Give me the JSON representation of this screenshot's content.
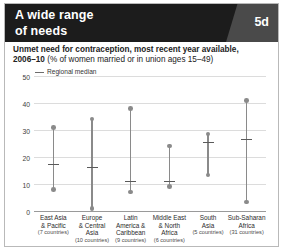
{
  "header": {
    "title_line1": "A wide range",
    "title_line2": "of needs",
    "figure_tag": "5d"
  },
  "subtitle": {
    "line1": "Unmet need for contraception, most recent year available,",
    "line2_bold": "2006–10",
    "line2_rest": " (% of women married or in union ages 15–49)"
  },
  "legend": {
    "label": "Regional median"
  },
  "colors": {
    "header_bg": "#1c1c1c",
    "tag_bg": "#4a4a4a",
    "marker": "#8a8a8a",
    "median": "#5a5a5a",
    "grid": "#dcdcdc"
  },
  "chart_data": {
    "type": "range",
    "title": "Unmet need for contraception, most recent year available, 2006–10 (% of women married or in union ages 15–49)",
    "xlabel": "",
    "ylabel": "",
    "ylim": [
      0,
      50
    ],
    "yticks": [
      0,
      10,
      20,
      30,
      40,
      50
    ],
    "grid": true,
    "legend_position": "top-left",
    "legend_entries": [
      "Regional median"
    ],
    "categories": [
      "East Asia & Pacific",
      "Europe & Central Asia",
      "Latin America & Caribbean",
      "Middle East & North Africa",
      "South Asia",
      "Sub-Saharan Africa"
    ],
    "category_lines": [
      [
        "East Asia",
        "& Pacific"
      ],
      [
        "Europe",
        "& Central",
        "Asia"
      ],
      [
        "Latin",
        "America &",
        "Caribbean"
      ],
      [
        "Middle East",
        "& North",
        "Africa"
      ],
      [
        "South",
        "Asia"
      ],
      [
        "Sub-Saharan",
        "Africa"
      ]
    ],
    "country_counts": [
      "(7 countries)",
      "(10 countries)",
      "(9 countries)",
      "(6 countries)",
      "(5 countries)",
      "(31 countries)"
    ],
    "series": [
      {
        "name": "Maximum",
        "values": [
          31,
          34,
          38,
          24,
          28.5,
          41
        ]
      },
      {
        "name": "Regional median",
        "values": [
          17,
          16,
          11,
          11,
          25.3,
          26.4
        ]
      },
      {
        "name": "Minimum",
        "values": [
          8,
          1,
          7,
          9,
          13.3,
          3.3
        ]
      }
    ]
  }
}
